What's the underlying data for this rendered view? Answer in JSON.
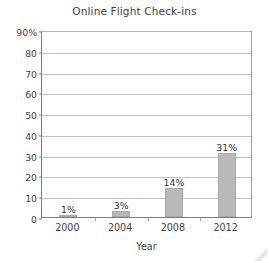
{
  "chart_data": {
    "type": "bar",
    "title": "Online Flight Check-ins",
    "xlabel": "Year",
    "ylabel": "",
    "categories": [
      "2000",
      "2004",
      "2008",
      "2012"
    ],
    "values": [
      1,
      3,
      14,
      31
    ],
    "data_labels": [
      "1%",
      "3%",
      "14%",
      "31%"
    ],
    "ylim": [
      0,
      90
    ],
    "ytick_values": [
      90,
      80,
      70,
      60,
      50,
      40,
      30,
      20,
      10,
      0
    ],
    "ytick_labels": [
      "90%",
      "80",
      "70",
      "60",
      "50",
      "40",
      "30",
      "20",
      "10",
      "0"
    ],
    "grid": true,
    "legend": false,
    "colors": {
      "bar_fill": "#b9b9b9",
      "bar_border": "#a9a9a9",
      "gridline": "#c3c3c3",
      "axis": "#7b7b7b",
      "text": "#3f3f3f",
      "background": "#ffffff"
    }
  }
}
